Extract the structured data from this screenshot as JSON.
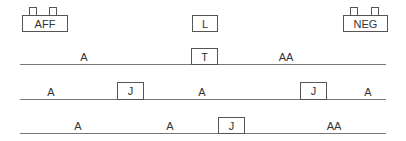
{
  "top": {
    "left_box": "AFF",
    "center_box": "L",
    "right_box": "NEG"
  },
  "rows": [
    {
      "labels": [
        "A",
        "AA"
      ],
      "boxes": [
        "T"
      ]
    },
    {
      "labels": [
        "A",
        "A",
        "A"
      ],
      "boxes": [
        "J",
        "J"
      ]
    },
    {
      "labels": [
        "A",
        "A",
        "AA"
      ],
      "boxes": [
        "J"
      ]
    }
  ],
  "colors": {
    "stroke": "#555555",
    "line": "#777777",
    "text": "#333333"
  }
}
